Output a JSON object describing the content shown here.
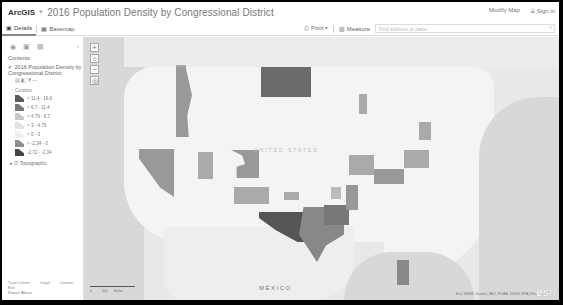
{
  "header": {
    "brand": "ArcGIS",
    "title": "2016 Population Density by Congressional District",
    "user_link": "Modify Map",
    "sign_in": "Sign in"
  },
  "tabs": [
    {
      "label": "Details",
      "active": true
    },
    {
      "label": "Basemap",
      "active": false
    }
  ],
  "toolbar": {
    "print_label": "Print",
    "measure_label": "Measure",
    "search_placeholder": "Find address or place"
  },
  "sidebar": {
    "section_title": "Contents",
    "layer_name": "2016 Population Density by Congressional District",
    "legend_title": "Custom",
    "legend": [
      {
        "label": "> 11.4 - 16.6",
        "color": "#5a5a5a"
      },
      {
        "label": "> 6.7 - 11.4",
        "color": "#7a7a7a"
      },
      {
        "label": "> 4.79 - 6.7",
        "color": "#c8c8c8"
      },
      {
        "label": "> 3 - 4.79",
        "color": "#e2e2e2"
      },
      {
        "label": "> 0 - 3",
        "color": "#efefef"
      },
      {
        "label": "> -2.34 - 0",
        "color": "#8d8d8d"
      },
      {
        "label": "-2.72 - -2.34",
        "color": "#444444"
      }
    ],
    "basemap_layer": "Topographic",
    "footer_links": [
      "Trust Center",
      "Legal",
      "Contact Esri",
      "Report Abuse"
    ]
  },
  "map": {
    "zoom_controls": [
      "+",
      "⌂",
      "−",
      "◎"
    ],
    "labels": {
      "mexico": "MÉXICO",
      "united_states": "UNITED STATES"
    },
    "scale_labels": [
      "0",
      "300",
      "600mi"
    ],
    "attribution": "Esri, HERE, Garmin, FAO, NOAA, USGS, EPA | Esri",
    "logo": "esri"
  }
}
